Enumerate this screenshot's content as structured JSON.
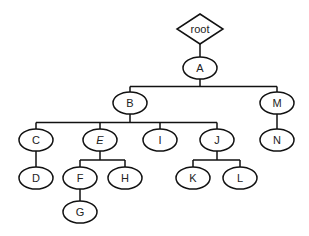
{
  "diagram": {
    "type": "tree",
    "root": {
      "id": "root",
      "label": "root",
      "shape": "diamond",
      "x": 200,
      "y": 29,
      "w": 46,
      "h": 30
    },
    "nodes": [
      {
        "id": "A",
        "label": "A",
        "x": 200,
        "y": 68,
        "italic": false
      },
      {
        "id": "B",
        "label": "B",
        "x": 130,
        "y": 103,
        "italic": false
      },
      {
        "id": "M",
        "label": "M",
        "x": 277,
        "y": 103,
        "italic": false
      },
      {
        "id": "C",
        "label": "C",
        "x": 36,
        "y": 140,
        "italic": false
      },
      {
        "id": "E",
        "label": "E",
        "x": 100,
        "y": 140,
        "italic": true
      },
      {
        "id": "I",
        "label": "I",
        "x": 160,
        "y": 140,
        "italic": false
      },
      {
        "id": "J",
        "label": "J",
        "x": 217,
        "y": 140,
        "italic": false
      },
      {
        "id": "N",
        "label": "N",
        "x": 277,
        "y": 140,
        "italic": false
      },
      {
        "id": "D",
        "label": "D",
        "x": 36,
        "y": 178,
        "italic": false
      },
      {
        "id": "F",
        "label": "F",
        "x": 80,
        "y": 178,
        "italic": false
      },
      {
        "id": "H",
        "label": "H",
        "x": 125,
        "y": 178,
        "italic": false
      },
      {
        "id": "K",
        "label": "K",
        "x": 193,
        "y": 178,
        "italic": false
      },
      {
        "id": "L",
        "label": "L",
        "x": 240,
        "y": 178,
        "italic": false
      },
      {
        "id": "G",
        "label": "G",
        "x": 80,
        "y": 212,
        "italic": false
      }
    ],
    "edges": [
      [
        "root",
        "A"
      ],
      [
        "A",
        "B"
      ],
      [
        "A",
        "M"
      ],
      [
        "B",
        "C"
      ],
      [
        "B",
        "E"
      ],
      [
        "B",
        "I"
      ],
      [
        "B",
        "J"
      ],
      [
        "M",
        "N"
      ],
      [
        "C",
        "D"
      ],
      [
        "E",
        "F"
      ],
      [
        "E",
        "H"
      ],
      [
        "J",
        "K"
      ],
      [
        "J",
        "L"
      ],
      [
        "F",
        "G"
      ]
    ],
    "node_rx": 17,
    "node_ry": 11
  }
}
